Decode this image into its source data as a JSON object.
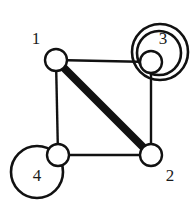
{
  "figure": {
    "kind": "undirected-multigraph-diagram",
    "background_color": "#ffffff",
    "ink_color": "#111111",
    "canvas": {
      "width": 192,
      "height": 207
    }
  },
  "graph_data": {
    "type": "node-link-diagram",
    "node_radius": 11,
    "node_fill": "#ffffff",
    "node_stroke": "#111111",
    "node_stroke_width": 2.4,
    "nodes": [
      {
        "id": "1",
        "label": "1",
        "cx": 56,
        "cy": 60,
        "label_x": 36,
        "label_y": 40,
        "self_loops": 0
      },
      {
        "id": "3",
        "label": "3",
        "cx": 151,
        "cy": 62,
        "label_x": 163,
        "label_y": 40,
        "self_loops": 2
      },
      {
        "id": "4",
        "label": "4",
        "cx": 58,
        "cy": 155,
        "label_x": 37,
        "label_y": 177,
        "self_loops": 1
      },
      {
        "id": "2",
        "label": "2",
        "cx": 151,
        "cy": 155,
        "label_x": 170,
        "label_y": 177,
        "self_loops": 0
      }
    ],
    "edges": [
      {
        "id": "e-1-3",
        "source": "1",
        "target": "3",
        "x1": 56,
        "y1": 60,
        "x2": 151,
        "y2": 62,
        "width": 2.4,
        "style": "thin"
      },
      {
        "id": "e-1-4",
        "source": "1",
        "target": "4",
        "x1": 56,
        "y1": 60,
        "x2": 58,
        "y2": 155,
        "width": 2.4,
        "style": "thin"
      },
      {
        "id": "e-4-2",
        "source": "4",
        "target": "2",
        "x1": 58,
        "y1": 155,
        "x2": 151,
        "y2": 155,
        "width": 2.4,
        "style": "thin"
      },
      {
        "id": "e-3-2",
        "source": "3",
        "target": "2",
        "x1": 151,
        "y1": 62,
        "x2": 151,
        "y2": 155,
        "width": 2.4,
        "style": "thin"
      },
      {
        "id": "e-1-2",
        "source": "1",
        "target": "2",
        "x1": 56,
        "y1": 60,
        "x2": 151,
        "y2": 155,
        "width": 8,
        "style": "thick"
      }
    ],
    "loops": [
      {
        "id": "loop-3-inner",
        "node": "3",
        "cx": 159,
        "cy": 53,
        "r": 22,
        "width": 2.6
      },
      {
        "id": "loop-3-outer",
        "node": "3",
        "cx": 160,
        "cy": 52,
        "r": 28,
        "width": 2.6
      },
      {
        "id": "loop-4",
        "node": "4",
        "cx": 37,
        "cy": 172,
        "r": 26,
        "width": 2.6
      }
    ]
  }
}
